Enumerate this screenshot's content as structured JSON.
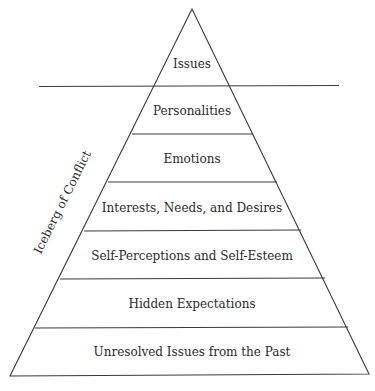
{
  "diagram": {
    "title_side": "Iceberg of Conflict",
    "above_water": [
      {
        "label": "Issues"
      }
    ],
    "below_water": [
      {
        "label": "Personalities"
      },
      {
        "label": "Emotions"
      },
      {
        "label": "Interests, Needs, and Desires"
      },
      {
        "label": "Self-Perceptions and Self-Esteem"
      },
      {
        "label": "Hidden Expectations"
      },
      {
        "label": "Unresolved Issues from the Past"
      }
    ]
  }
}
